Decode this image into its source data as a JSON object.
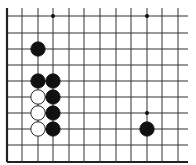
{
  "board": {
    "background": "#ffffff",
    "line_color": "#333333",
    "edge_color": "#222222",
    "columns_x": [
      7,
      22,
      38,
      53,
      69,
      84,
      100,
      116,
      131,
      147,
      162,
      178
    ],
    "rows_y": [
      16,
      33,
      49,
      65,
      81,
      97,
      113,
      129,
      145,
      162
    ],
    "line_extent": {
      "x_min": 7,
      "x_max": 188,
      "y_min": 8,
      "y_max": 162
    },
    "edges": [
      "left",
      "bottom"
    ],
    "star_points": [
      {
        "col": 3,
        "row": 0
      },
      {
        "col": 9,
        "row": 0
      },
      {
        "col": 9,
        "row": 6
      }
    ],
    "stone_radius": 7.2
  },
  "stones": [
    {
      "color": "black",
      "col": 2,
      "row": 2
    },
    {
      "color": "black",
      "col": 2,
      "row": 4
    },
    {
      "color": "black",
      "col": 3,
      "row": 4
    },
    {
      "color": "white",
      "col": 2,
      "row": 5
    },
    {
      "color": "black",
      "col": 3,
      "row": 5
    },
    {
      "color": "white",
      "col": 2,
      "row": 6
    },
    {
      "color": "black",
      "col": 3,
      "row": 6
    },
    {
      "color": "white",
      "col": 2,
      "row": 7
    },
    {
      "color": "black",
      "col": 3,
      "row": 7
    },
    {
      "color": "black",
      "col": 9,
      "row": 7
    }
  ]
}
